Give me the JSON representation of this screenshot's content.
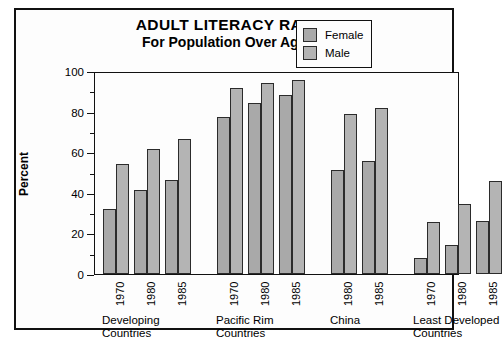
{
  "chart_data": {
    "type": "bar",
    "title": "ADULT LITERACY RATES",
    "subtitle": "For Population Over Age 14",
    "xlabel": "",
    "ylabel": "Percent",
    "ylim": [
      0,
      100
    ],
    "ytick_labels": [
      "0",
      "20",
      "40",
      "60",
      "80",
      "100"
    ],
    "ytick_values": [
      0,
      20,
      40,
      60,
      80,
      100
    ],
    "yminor_values": [
      10,
      30,
      50,
      70,
      90
    ],
    "grid": false,
    "legend_position": "top-right",
    "legend": [
      "Female",
      "Male"
    ],
    "colors": {
      "female": "#a9a9a9",
      "male": "#b4b4b4",
      "bar_border": "#2b2b2b",
      "axis": "#111111",
      "background": "#fdfdfd",
      "text": "#000000"
    },
    "groups": [
      {
        "name": "Developing Countries",
        "name_lines": [
          "Developing",
          "Countries"
        ],
        "years": [
          "1970",
          "1980",
          "1985"
        ],
        "female": [
          32,
          41.5,
          46.5
        ],
        "male": [
          54,
          61.5,
          66.5
        ]
      },
      {
        "name": "Pacific Rim Countries",
        "name_lines": [
          "Pacific Rim",
          "Countries"
        ],
        "years": [
          "1970",
          "1980",
          "1985"
        ],
        "female": [
          77.5,
          84,
          88
        ],
        "male": [
          91.5,
          94,
          95.5
        ]
      },
      {
        "name": "China",
        "name_lines": [
          "China",
          ""
        ],
        "years": [
          "1980",
          "1985"
        ],
        "female": [
          51,
          55.5
        ],
        "male": [
          79,
          82
        ]
      },
      {
        "name": "Least Developed Countries",
        "name_lines": [
          "Least Developed",
          "Countries"
        ],
        "years": [
          "1970",
          "1980",
          "1985"
        ],
        "female": [
          8,
          14.5,
          26
        ],
        "male": [
          25.5,
          34.5,
          46
        ]
      }
    ]
  }
}
